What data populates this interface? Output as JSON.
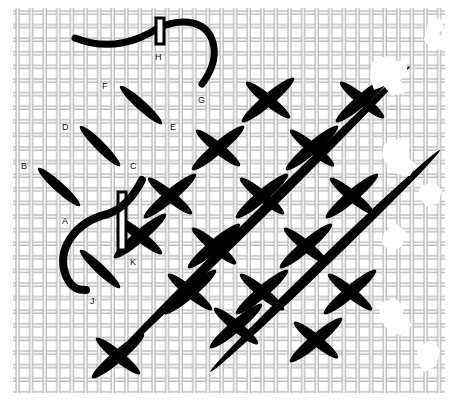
{
  "diagram": {
    "type": "needlework-cross-stitch-illustration",
    "background_color": "#ffffff",
    "canvas_color": "#9a9a9a",
    "thread_color": "#000000",
    "labels": [
      {
        "id": "H",
        "text": "H",
        "x": 155,
        "y": 53
      },
      {
        "id": "G",
        "text": "G",
        "x": 198,
        "y": 96
      },
      {
        "id": "F",
        "text": "F",
        "x": 102,
        "y": 82
      },
      {
        "id": "E",
        "text": "E",
        "x": 170,
        "y": 123
      },
      {
        "id": "D",
        "text": "D",
        "x": 62,
        "y": 123
      },
      {
        "id": "C",
        "text": "C",
        "x": 130,
        "y": 162
      },
      {
        "id": "B",
        "text": "B",
        "x": 21,
        "y": 162
      },
      {
        "id": "A",
        "text": "A",
        "x": 62,
        "y": 217
      },
      {
        "id": "K",
        "text": "K",
        "x": 130,
        "y": 258
      },
      {
        "id": "J",
        "text": "J",
        "x": 90,
        "y": 297
      }
    ]
  }
}
